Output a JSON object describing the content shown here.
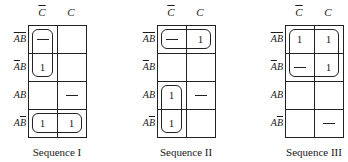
{
  "col_headers": [
    "C̄",
    "C"
  ],
  "row_headers": [
    "ĀB̄",
    "ĀB",
    "AB",
    "AB̄"
  ],
  "col_header_parts": [
    {
      "base": "C",
      "bar": true
    },
    {
      "base": "C",
      "bar": false
    }
  ],
  "row_header_parts": [
    [
      {
        "t": "A",
        "bar": true
      },
      {
        "t": "B",
        "bar": true
      }
    ],
    [
      {
        "t": "A",
        "bar": true
      },
      {
        "t": "B",
        "bar": false
      }
    ],
    [
      {
        "t": "A",
        "bar": false
      },
      {
        "t": "B",
        "bar": false
      }
    ],
    [
      {
        "t": "A",
        "bar": false
      },
      {
        "t": "B",
        "bar": true
      }
    ]
  ],
  "maps": [
    {
      "caption": "Sequence I",
      "cells": [
        [
          "-",
          ""
        ],
        [
          "1",
          ""
        ],
        [
          "",
          "-"
        ],
        [
          "1",
          "1"
        ]
      ],
      "loops": [
        {
          "rows": [
            0,
            1
          ],
          "cols": [
            0,
            0
          ]
        },
        {
          "rows": [
            3,
            3
          ],
          "cols": [
            0,
            1
          ]
        }
      ]
    },
    {
      "caption": "Sequence II",
      "cells": [
        [
          "-",
          "1"
        ],
        [
          "",
          ""
        ],
        [
          "1",
          "-"
        ],
        [
          "1",
          ""
        ]
      ],
      "loops": [
        {
          "rows": [
            0,
            0
          ],
          "cols": [
            0,
            1
          ]
        },
        {
          "rows": [
            2,
            3
          ],
          "cols": [
            0,
            0
          ]
        }
      ]
    },
    {
      "caption": "Sequence III",
      "cells": [
        [
          "1",
          "1"
        ],
        [
          "-",
          "1"
        ],
        [
          "",
          ""
        ],
        [
          "",
          "-"
        ]
      ],
      "loops": [
        {
          "rows": [
            0,
            1
          ],
          "cols": [
            0,
            1
          ]
        }
      ]
    }
  ]
}
